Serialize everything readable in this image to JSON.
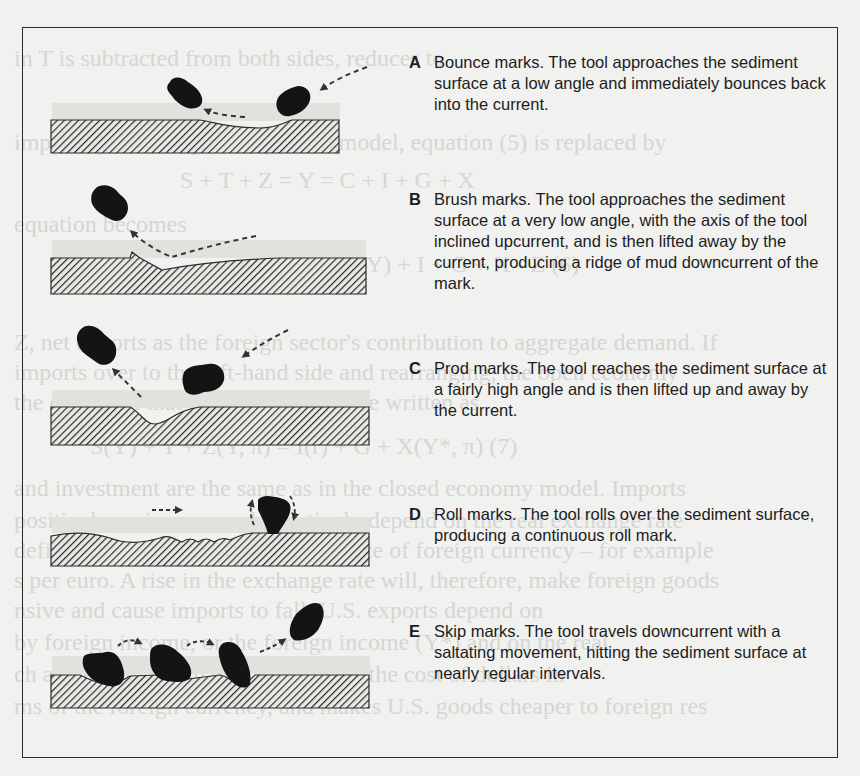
{
  "figure": {
    "panels": [
      {
        "letter": "A",
        "name": "Bounce marks",
        "text": "Bounce marks. The tool approaches the sediment surface at a low angle and immediately bounces back into the current."
      },
      {
        "letter": "B",
        "name": "Brush marks",
        "text": "Brush marks. The tool approaches the sediment surface at a very low angle, with the axis of the tool inclined upcurrent, and is then lifted away by the current, producing a ridge of mud downcurrent of the mark."
      },
      {
        "letter": "C",
        "name": "Prod marks",
        "text": "Prod marks. The tool reaches the sediment surface at a fairly high angle and is then lifted up and away by the current."
      },
      {
        "letter": "D",
        "name": "Roll marks",
        "text": "Roll marks. The tool rolls over the sediment surface, producing a continuous roll mark."
      },
      {
        "letter": "E",
        "name": "Skip marks",
        "text": "Skip marks. The tool travels downcurrent with a saltating movement, hitting the sediment surface at nearly regular intervals."
      }
    ]
  },
  "bleed_through": [
    "in T is subtracted from both sides, reduces to",
    "imports (2) and exports (3) to the model, equation (5) is replaced by",
    "S + T + Z = Y = C + I + G + X",
    "equation becomes",
    "Y = C(Y) + I + G + X - Z                    (6)",
    "Z, net exports as the foreign sector's contribution to aggregate demand. If",
    "imports over to the left-hand side and rearranging, the open economy",
    "the condition that the economy can be written as",
    "S(Y) + T + Z(Y, π) = I(r) + G + X(Y*, π)                 (7)",
    "and investment are the same as in the closed economy model. Imports",
    "positively on income and negatively depend on the real exchange rate",
    "defining the exchange rate as the price of foreign currency – for example",
    "s per euro. A rise in the exchange rate will, therefore, make foreign goods",
    "nsive and cause imports to fall. U.S. exports depend on",
    "by foreign income, or the foreign income (Y*) and on the real",
    "ch a rise in the exchange rate lowers the cost of dollars in",
    "ms of the foreign currency, and makes U.S. goods cheaper to foreign res"
  ]
}
